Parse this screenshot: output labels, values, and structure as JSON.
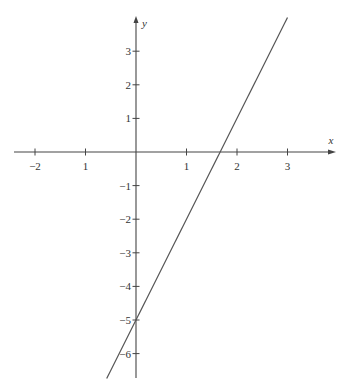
{
  "chart_data": {
    "type": "line",
    "title": "",
    "xlabel": "x",
    "ylabel": "y",
    "x_ticks": [
      {
        "value": -2,
        "label": "-2"
      },
      {
        "value": -1,
        "label": "1"
      },
      {
        "value": 1,
        "label": "1"
      },
      {
        "value": 2,
        "label": "2"
      },
      {
        "value": 3,
        "label": "3"
      }
    ],
    "y_ticks": [
      {
        "value": 3,
        "label": "3"
      },
      {
        "value": 2,
        "label": "2"
      },
      {
        "value": 1,
        "label": "1"
      },
      {
        "value": -1,
        "label": "-1"
      },
      {
        "value": -2,
        "label": "-2"
      },
      {
        "value": -3,
        "label": "-3"
      },
      {
        "value": -4,
        "label": "-4"
      },
      {
        "value": -5,
        "label": "-5"
      },
      {
        "value": -6,
        "label": "-6"
      }
    ],
    "xlim": [
      -2.4,
      4.0
    ],
    "ylim": [
      -6.8,
      4.1
    ],
    "grid": false,
    "series": [
      {
        "name": "y = 3x - 5",
        "equation": {
          "slope": 3,
          "intercept": -5
        },
        "x": [
          -0.58,
          3.0
        ],
        "y": [
          -6.74,
          4.0
        ]
      }
    ],
    "annotations": {
      "x_intercept": 1.667,
      "y_intercept": -5
    }
  },
  "colors": {
    "axis": "#444444",
    "line": "#555555",
    "text": "#333333"
  }
}
